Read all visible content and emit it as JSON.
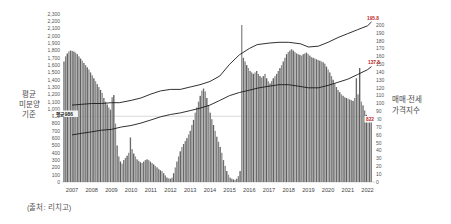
{
  "source_note": "(출처: 리치고)",
  "left_axis": {
    "title_lines": [
      "평균",
      "미분양",
      "기준"
    ],
    "ticks": [
      "2,300",
      "2,200",
      "2,100",
      "2,000",
      "1,900",
      "1,800",
      "1,700",
      "1,600",
      "1,500",
      "1,400",
      "1,300",
      "1,200",
      "1,100",
      "1,000",
      "900",
      "800",
      "700",
      "600",
      "500",
      "400",
      "300",
      "200",
      "100",
      "0"
    ]
  },
  "right_axis": {
    "title_lines": [
      "매매·전세",
      "가격지수"
    ],
    "ticks": [
      "200",
      "190",
      "180",
      "170",
      "160",
      "150",
      "140",
      "130",
      "120",
      "110",
      "100",
      "90",
      "80",
      "70",
      "60",
      "50",
      "40",
      "30",
      "20",
      "10",
      "0"
    ]
  },
  "annotations": {
    "average_label": "평균 986",
    "sale_end_label": "195.8",
    "jeonse_end_label": "137.8",
    "last_bar_label": "822"
  },
  "colors": {
    "bar_shades": [
      "#6b6b6b",
      "#818181",
      "#5e5e5e",
      "#8f8f8f"
    ],
    "line": "#1a1a1a",
    "average_line": "#cfcfcf",
    "callout_red": "#bb2222",
    "tick_text": "#555555",
    "year_text": "#444444"
  },
  "chart_data": {
    "type": "bar",
    "title": "",
    "xlabel": "",
    "ylabel_left": "평균 미분양 기준",
    "ylabel_right": "매매·전세 가격지수",
    "left_ylim": [
      0,
      2300
    ],
    "left_tick_step": 100,
    "right_ylim": [
      0,
      200
    ],
    "right_tick_step": 10,
    "grid": false,
    "legend_position": "none",
    "x_years": [
      2007,
      2008,
      2009,
      2010,
      2011,
      2012,
      2013,
      2014,
      2015,
      2016,
      2017,
      2018,
      2019,
      2020,
      2021,
      2022
    ],
    "bars": {
      "name": "미분양(월별, 추정값)",
      "axis": "left",
      "monthly_start": "2007-01",
      "values": [
        1650,
        1720,
        1760,
        1790,
        1800,
        1795,
        1785,
        1770,
        1750,
        1720,
        1690,
        1660,
        1630,
        1600,
        1570,
        1540,
        1500,
        1460,
        1420,
        1380,
        1340,
        1300,
        1260,
        1220,
        1150,
        1100,
        1060,
        1020,
        990,
        1160,
        1190,
        800,
        500,
        350,
        280,
        250,
        300,
        330,
        360,
        400,
        610,
        450,
        390,
        350,
        310,
        290,
        270,
        260,
        280,
        300,
        310,
        300,
        280,
        260,
        240,
        220,
        200,
        180,
        160,
        150,
        120,
        90,
        60,
        50,
        45,
        60,
        120,
        200,
        280,
        350,
        420,
        480,
        520,
        560,
        600,
        650,
        700,
        780,
        850,
        950,
        1020,
        1100,
        1180,
        1250,
        1280,
        1240,
        1150,
        1050,
        950,
        860,
        780,
        700,
        620,
        550,
        480,
        400,
        300,
        220,
        150,
        100,
        60,
        45,
        35,
        30,
        45,
        80,
        150,
        2150,
        1700,
        1650,
        1600,
        1560,
        1520,
        1500,
        1480,
        1500,
        1520,
        1480,
        1450,
        1430,
        1450,
        1480,
        1420,
        1380,
        1350,
        1380,
        1420,
        1450,
        1480,
        1520,
        1560,
        1600,
        1650,
        1700,
        1750,
        1780,
        1800,
        1820,
        1800,
        1780,
        1760,
        1750,
        1740,
        1730,
        1750,
        1760,
        1770,
        1750,
        1730,
        1710,
        1700,
        1690,
        1680,
        1670,
        1660,
        1650,
        1640,
        1620,
        1580,
        1540,
        1500,
        1450,
        1400,
        1350,
        1300,
        1260,
        1230,
        1200,
        1180,
        1160,
        1150,
        1140,
        1130,
        1120,
        1110,
        1150,
        1420,
        1200,
        1560,
        1100,
        1050,
        980,
        920,
        880,
        850,
        822
      ]
    },
    "series": [
      {
        "name": "매매 가격지수",
        "axis": "right",
        "end_label": "195.8",
        "points": [
          [
            2007,
            98
          ],
          [
            2007.5,
            99
          ],
          [
            2008,
            100
          ],
          [
            2008.5,
            100
          ],
          [
            2009,
            101
          ],
          [
            2009.4,
            101
          ],
          [
            2010,
            104
          ],
          [
            2010.5,
            107
          ],
          [
            2011,
            112
          ],
          [
            2011.5,
            116
          ],
          [
            2012,
            118
          ],
          [
            2012.5,
            118
          ],
          [
            2013,
            121
          ],
          [
            2013.5,
            124
          ],
          [
            2014,
            128
          ],
          [
            2014.5,
            135
          ],
          [
            2015,
            150
          ],
          [
            2015.5,
            162
          ],
          [
            2016,
            170
          ],
          [
            2016.4,
            175
          ],
          [
            2017,
            177
          ],
          [
            2017.5,
            178
          ],
          [
            2018,
            178
          ],
          [
            2018.6,
            176
          ],
          [
            2019,
            172
          ],
          [
            2019.5,
            173
          ],
          [
            2020,
            178
          ],
          [
            2020.5,
            184
          ],
          [
            2021,
            189
          ],
          [
            2021.5,
            194
          ],
          [
            2022,
            199
          ],
          [
            2022.3,
            204
          ]
        ]
      },
      {
        "name": "전세 가격지수",
        "axis": "right",
        "end_label": "137.8",
        "points": [
          [
            2007,
            60
          ],
          [
            2007.5,
            62
          ],
          [
            2008,
            64
          ],
          [
            2008.5,
            66
          ],
          [
            2009,
            67
          ],
          [
            2009.5,
            70
          ],
          [
            2010,
            72
          ],
          [
            2010.5,
            75
          ],
          [
            2011,
            79
          ],
          [
            2011.5,
            83
          ],
          [
            2012,
            86
          ],
          [
            2012.5,
            88
          ],
          [
            2013,
            91
          ],
          [
            2013.5,
            94
          ],
          [
            2014,
            98
          ],
          [
            2014.5,
            104
          ],
          [
            2015,
            110
          ],
          [
            2015.5,
            114
          ],
          [
            2016,
            117
          ],
          [
            2016.5,
            120
          ],
          [
            2017,
            122
          ],
          [
            2017.5,
            124
          ],
          [
            2018,
            124
          ],
          [
            2018.5,
            122
          ],
          [
            2019,
            120
          ],
          [
            2019.5,
            120
          ],
          [
            2020,
            123
          ],
          [
            2020.5,
            127
          ],
          [
            2021,
            131
          ],
          [
            2021.5,
            137
          ],
          [
            2022,
            143
          ],
          [
            2022.3,
            147
          ]
        ]
      }
    ],
    "average_line": {
      "axis": "left",
      "value": 900,
      "label": "평균 986"
    },
    "last_bar_callout": "822"
  }
}
